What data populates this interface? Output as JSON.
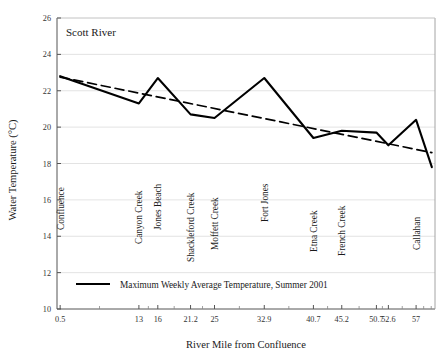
{
  "chart_data": {
    "type": "line",
    "title": "Scott River",
    "xlabel": "River Mile from Confluence",
    "ylabel": "Water Temperature (°C)",
    "xlim": [
      0,
      60
    ],
    "ylim": [
      10,
      26
    ],
    "ytick_step": 2,
    "grid": true,
    "grid_axis": "y",
    "legend_position": "inside-bottom-left",
    "xtick_labels": [
      "0.5",
      "13",
      "16",
      "21.2",
      "25",
      "32.9",
      "40.7",
      "45.2",
      "50.7",
      "52.6",
      "57"
    ],
    "xtick_values": [
      0.5,
      13,
      16,
      21.2,
      25,
      32.9,
      40.7,
      45.2,
      50.7,
      52.6,
      57
    ],
    "ytick_labels": [
      "10",
      "12",
      "14",
      "16",
      "18",
      "20",
      "22",
      "24",
      "26"
    ],
    "ytick_values": [
      10,
      12,
      14,
      16,
      18,
      20,
      22,
      24,
      26
    ],
    "series": [
      {
        "name": "Maximum Weekly Average Temperature, Summer 2001",
        "style": "solid",
        "color": "#000000",
        "x": [
          0.5,
          13,
          16,
          21.2,
          25,
          32.9,
          40.7,
          45.2,
          50.7,
          52.6,
          57,
          59.5
        ],
        "values": [
          22.8,
          21.3,
          22.7,
          20.7,
          20.5,
          22.7,
          19.4,
          19.8,
          19.7,
          19.0,
          20.4,
          17.8
        ]
      },
      {
        "name": "Trend line",
        "style": "dashed",
        "color": "#000000",
        "x": [
          0.5,
          59.5
        ],
        "values": [
          22.75,
          18.6
        ]
      }
    ],
    "point_labels": [
      {
        "label": "Confluence",
        "x": 0.5
      },
      {
        "label": "Canyon Creek",
        "x": 13
      },
      {
        "label": "Jones Beach",
        "x": 16
      },
      {
        "label": "Shackleford Creek",
        "x": 21.2
      },
      {
        "label": "Moffett Creek",
        "x": 25
      },
      {
        "label": "Fort Jones",
        "x": 32.9
      },
      {
        "label": "Etna Creek",
        "x": 40.7
      },
      {
        "label": "French Creek",
        "x": 45.2
      },
      {
        "label": "Callahan",
        "x": 57
      }
    ],
    "legend": [
      {
        "label": "Maximum Weekly Average Temperature, Summer 2001",
        "style": "solid",
        "color": "#000000"
      }
    ]
  }
}
